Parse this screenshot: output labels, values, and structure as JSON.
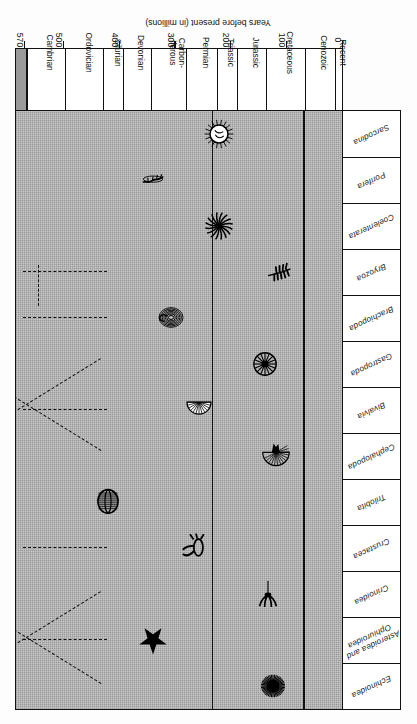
{
  "figure": {
    "kind": "spindle-range-diagram",
    "axis_title": "Years before present (in millions)"
  },
  "taxa": [
    {
      "name": "Echinoidea"
    },
    {
      "name": "Asteroidea and Ophiuroidea"
    },
    {
      "name": "Crinoidea"
    },
    {
      "name": "Crustacea"
    },
    {
      "name": "Trilobita"
    },
    {
      "name": "Cephalopoda"
    },
    {
      "name": "Bivalvia"
    },
    {
      "name": "Gastropoda"
    },
    {
      "name": "Brachiopoda"
    },
    {
      "name": "Bryozoa"
    },
    {
      "name": "Coelenterata"
    },
    {
      "name": "Porifera"
    },
    {
      "name": "Sarcodina"
    }
  ],
  "periods": [
    {
      "label": "Recent",
      "start": 0,
      "end": 12
    },
    {
      "label": "Cenozoic",
      "start": 12,
      "end": 65
    },
    {
      "label": "Cretaceous",
      "start": 65,
      "end": 136
    },
    {
      "label": "Jurassic",
      "start": 136,
      "end": 190
    },
    {
      "label": "Triassic",
      "start": 190,
      "end": 225
    },
    {
      "label": "Permian",
      "start": 225,
      "end": 280
    },
    {
      "label": "Carbon-\niferous",
      "start": 280,
      "end": 345
    },
    {
      "label": "Devonian",
      "start": 345,
      "end": 395
    },
    {
      "label": "Silurian",
      "start": 395,
      "end": 430
    },
    {
      "label": "Ordovician",
      "start": 430,
      "end": 500
    },
    {
      "label": "Cambrian",
      "start": 500,
      "end": 570
    }
  ],
  "ticks": [
    {
      "value": 0,
      "label": "0"
    },
    {
      "value": 100,
      "label": "100"
    },
    {
      "value": 200,
      "label": "200"
    },
    {
      "value": 300,
      "label": "300"
    },
    {
      "value": 400,
      "label": "400"
    },
    {
      "value": 500,
      "label": "500"
    },
    {
      "value": 570,
      "label": "570"
    }
  ],
  "colors": {
    "background_grey": "#9a9a9a",
    "spindle_white": "#ffffff",
    "ink": "#111111"
  },
  "chart_data": {
    "type": "area",
    "xlabel": "Years before present (in millions)",
    "ylabel": "",
    "xlim": [
      0,
      570
    ],
    "grid": true,
    "legend": "none",
    "note": "Each lane is a symmetric spindle whose width represents relative abundance/diversity of the group; dashed lines mark inferred or extinct ranges.",
    "gridlines_at": [
      65,
      225
    ],
    "series": [
      {
        "name": "Echinoidea",
        "fossil_icon": "sea-urchin-icon",
        "widths": [
          0.62,
          0.7,
          0.8,
          0.92,
          0.86,
          0.7,
          0.58,
          0.46,
          0.34,
          0.22,
          0.1,
          0.0
        ],
        "dashed_extension": false
      },
      {
        "name": "Asteroidea and Ophiuroidea",
        "fossil_icon": "starfish-icon",
        "widths": [
          0.58,
          0.62,
          0.66,
          0.7,
          0.66,
          0.58,
          0.5,
          0.42,
          0.32,
          0.2,
          0.08,
          0.0
        ],
        "dashed_extension": true
      },
      {
        "name": "Crinoidea",
        "fossil_icon": "crinoid-icon",
        "widths": [
          0.3,
          0.4,
          0.56,
          0.74,
          0.88,
          0.96,
          0.9,
          0.78,
          0.6,
          0.4,
          0.18,
          0.0
        ],
        "dashed_extension": false
      },
      {
        "name": "Crustacea",
        "fossil_icon": "crustacean-icon",
        "widths": [
          0.72,
          0.78,
          0.84,
          0.88,
          0.84,
          0.76,
          0.64,
          0.52,
          0.4,
          0.26,
          0.12,
          0.0
        ],
        "dashed_extension": true
      },
      {
        "name": "Trilobita",
        "fossil_icon": "trilobite-icon",
        "widths": [
          0.0,
          0.0,
          0.0,
          0.0,
          0.06,
          0.22,
          0.46,
          0.7,
          0.88,
          0.96,
          0.7,
          0.3
        ],
        "dashed_extension": false
      },
      {
        "name": "Cephalopoda",
        "fossil_icon": "nautiloid-icon",
        "widths": [
          0.4,
          0.5,
          0.64,
          0.82,
          0.94,
          0.88,
          0.78,
          0.66,
          0.54,
          0.4,
          0.22,
          0.06
        ],
        "dashed_extension": false
      },
      {
        "name": "Bivalvia",
        "fossil_icon": "clam-shell-icon",
        "widths": [
          0.8,
          0.86,
          0.92,
          0.88,
          0.8,
          0.7,
          0.58,
          0.46,
          0.34,
          0.22,
          0.1,
          0.0
        ],
        "dashed_extension": true
      },
      {
        "name": "Gastropoda",
        "fossil_icon": "snail-shell-icon",
        "widths": [
          0.66,
          0.72,
          0.78,
          0.82,
          0.78,
          0.7,
          0.6,
          0.5,
          0.38,
          0.24,
          0.1,
          0.0
        ],
        "dashed_extension": false
      },
      {
        "name": "Brachiopoda",
        "fossil_icon": "brachiopod-icon",
        "widths": [
          0.18,
          0.24,
          0.34,
          0.48,
          0.64,
          0.82,
          0.94,
          0.86,
          0.7,
          0.5,
          0.26,
          0.06
        ],
        "dashed_extension": true
      },
      {
        "name": "Bryozoa",
        "fossil_icon": "bryozoan-icon",
        "widths": [
          0.44,
          0.52,
          0.62,
          0.74,
          0.82,
          0.88,
          0.82,
          0.72,
          0.58,
          0.4,
          0.18,
          0.0
        ],
        "dashed_extension": true
      },
      {
        "name": "Coelenterata",
        "fossil_icon": "coral-polyp-icon",
        "widths": [
          0.6,
          0.66,
          0.74,
          0.82,
          0.86,
          0.82,
          0.74,
          0.64,
          0.52,
          0.38,
          0.2,
          0.04
        ],
        "dashed_extension": false
      },
      {
        "name": "Porifera",
        "fossil_icon": "sponge-icon",
        "widths": [
          0.4,
          0.46,
          0.54,
          0.64,
          0.72,
          0.78,
          0.74,
          0.66,
          0.54,
          0.4,
          0.22,
          0.06
        ],
        "dashed_extension": false
      },
      {
        "name": "Sarcodina",
        "fossil_icon": "foraminifera-icon",
        "widths": [
          0.86,
          0.88,
          0.84,
          0.76,
          0.66,
          0.56,
          0.46,
          0.38,
          0.3,
          0.22,
          0.12,
          0.02
        ],
        "dashed_extension": false
      }
    ],
    "fossil_markers": [
      {
        "taxon": "Echinoidea",
        "at_ma": 120,
        "icon": "sea-urchin-icon"
      },
      {
        "taxon": "Asteroidea and Ophiuroidea",
        "at_ma": 330,
        "icon": "starfish-icon"
      },
      {
        "taxon": "Crinoidea",
        "at_ma": 130,
        "icon": "crinoid-icon"
      },
      {
        "taxon": "Crustacea",
        "at_ma": 255,
        "icon": "crustacean-icon"
      },
      {
        "taxon": "Trilobita",
        "at_ma": 410,
        "icon": "trilobite-icon"
      },
      {
        "taxon": "Cephalopoda",
        "at_ma": 115,
        "icon": "nautiloid-icon"
      },
      {
        "taxon": "Bivalvia",
        "at_ma": 250,
        "icon": "clam-shell-icon"
      },
      {
        "taxon": "Gastropoda",
        "at_ma": 135,
        "icon": "snail-shell-icon"
      },
      {
        "taxon": "Brachiopoda",
        "at_ma": 300,
        "icon": "brachiopod-icon"
      },
      {
        "taxon": "Bryozoa",
        "at_ma": 110,
        "icon": "bryozoan-icon"
      },
      {
        "taxon": "Coelenterata",
        "at_ma": 215,
        "icon": "coral-polyp-icon"
      },
      {
        "taxon": "Porifera",
        "at_ma": 330,
        "icon": "sponge-icon"
      },
      {
        "taxon": "Sarcodina",
        "at_ma": 215,
        "icon": "foraminifera-icon"
      }
    ]
  }
}
